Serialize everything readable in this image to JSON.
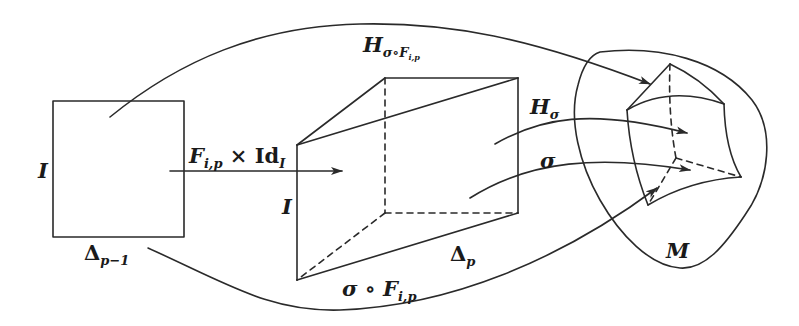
{
  "diagram": {
    "type": "commutative-geometry-diagram",
    "labels": {
      "square_left_side": "I",
      "square_bottom": "Δ",
      "square_bottom_sub": "p−1",
      "map_arrow": "F",
      "map_arrow_sub": "i,p",
      "map_arrow_times": " × ",
      "map_arrow_id": "Id",
      "map_arrow_id_sub": "I",
      "prism_left_side": "I",
      "prism_bottom": "Δ",
      "prism_bottom_sub": "p",
      "top_curve": "H",
      "top_curve_sub": "σ∘F",
      "top_curve_subsub": "i,p",
      "h_sigma": "H",
      "h_sigma_sub": "σ",
      "sigma": "σ",
      "bottom_curve": "σ ∘ F",
      "bottom_curve_sub": "i,p",
      "manifold": "M"
    },
    "nodes": [
      {
        "id": "square",
        "description": "square I × Δ_{p−1}"
      },
      {
        "id": "prism",
        "description": "prism I × Δ_p"
      },
      {
        "id": "manifold",
        "description": "curved prism image in manifold M"
      }
    ],
    "edges": [
      {
        "from": "square",
        "to": "prism",
        "label": "F_{i,p} × Id_I"
      },
      {
        "from": "square",
        "to": "manifold",
        "label": "H_{σ∘F_{i,p}}"
      },
      {
        "from": "prism",
        "to": "manifold",
        "label": "H_σ"
      },
      {
        "from": "prism",
        "to": "manifold",
        "label": "σ"
      },
      {
        "from": "square",
        "to": "manifold",
        "label": "σ ∘ F_{i,p}"
      }
    ],
    "colors": {
      "line": "#2a2a2a",
      "background": "#ffffff"
    }
  }
}
